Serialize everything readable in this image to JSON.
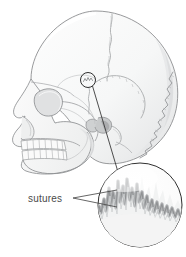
{
  "figure": {
    "name": "skull-sutures-diagram",
    "background_color": "#ffffff",
    "width": 186,
    "height": 257
  },
  "labels": {
    "sutures": "sutures"
  },
  "colors": {
    "outline": "#8d8f91",
    "outline_light": "#b5b7b9",
    "bone_fill": "#f7f8f8",
    "bone_shadow": "#e6e7e8",
    "bone_shadow_deep": "#d2d4d5",
    "suture_line": "#a9abad",
    "suture_band": "#b0b2b4",
    "callout_line": "#3a3a3a",
    "leader_line": "#4a4a4a",
    "label_text": "#4a4a4a",
    "circle_stroke": "#2f2f2f"
  },
  "parts": {
    "cranium": "cranial-vault",
    "frontal_bone": "frontal-bone",
    "parietal_bone": "parietal-bone",
    "occipital_bone": "occipital-bone",
    "temporal_bone": "temporal-bone",
    "orbit": "eye-socket",
    "nasal_aperture": "nasal-aperture",
    "zygomatic_arch": "zygomatic-arch",
    "maxilla_teeth": "upper-teeth-row",
    "mandible_teeth": "lower-teeth-row",
    "mandible": "mandible"
  },
  "callout": {
    "marker_circle": {
      "cx": 88,
      "cy": 80,
      "r": 7.5
    },
    "magnifier_circle": {
      "cx": 140,
      "cy": 205,
      "r": 42
    },
    "connector": {
      "x1": 92.5,
      "y1": 86,
      "x2": 118,
      "y2": 172
    },
    "leaders": [
      {
        "x1": 73,
        "y1": 198,
        "x2": 117,
        "y2": 190
      },
      {
        "x1": 73,
        "y1": 198,
        "x2": 117,
        "y2": 206
      }
    ],
    "label_position": {
      "x": 28,
      "y": 202
    }
  },
  "teeth": {
    "upper_count": 8,
    "lower_count": 8
  }
}
